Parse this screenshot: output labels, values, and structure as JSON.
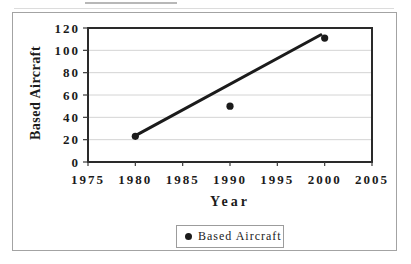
{
  "chart_data": {
    "type": "scatter",
    "title": "",
    "xlabel": "Year",
    "ylabel": "Based Aircraft",
    "xlim": [
      1975,
      2005
    ],
    "ylim": [
      0,
      120
    ],
    "x_ticks": [
      1975,
      1980,
      1985,
      1990,
      1995,
      2000,
      2005
    ],
    "y_ticks": [
      0,
      20,
      40,
      60,
      80,
      100,
      120
    ],
    "grid": "horizontal-faint",
    "legend_position": "bottom-center",
    "series": [
      {
        "name": "Based Aircraft",
        "marker": "filled-circle",
        "points": [
          {
            "x": 1980,
            "y": 23
          },
          {
            "x": 1990,
            "y": 50
          },
          {
            "x": 2000,
            "y": 111
          }
        ]
      }
    ],
    "trendline": {
      "from": {
        "x": 1980.3,
        "y": 25
      },
      "to": {
        "x": 1999.6,
        "y": 114
      }
    },
    "legend": {
      "entries": [
        {
          "marker": "filled-circle",
          "label": "Based Aircraft"
        }
      ]
    }
  },
  "colors": {
    "ink": "#1b1b1b",
    "plot_border": "#2a2a2a",
    "gridline": "#d4d4d4",
    "tick": "#3a3a3a",
    "frame_border": "#a3a3a3",
    "background": "#ffffff"
  }
}
